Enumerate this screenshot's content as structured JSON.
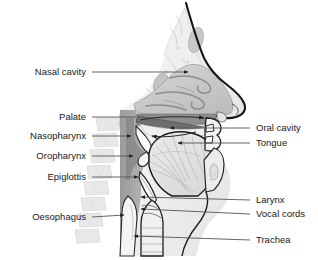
{
  "figure": {
    "background_color": "#ffffff",
    "text_color": "#1a1a1a",
    "leader_line_color": "#555555",
    "outline_color": "#1a1a1a"
  },
  "colors": {
    "skin_light": "#f2f2f2",
    "bone_light": "#e8e8e8",
    "nasal_cavity_fill": "#c9c9c9",
    "pharynx_fill": "#8f8f8f",
    "soft_tissue_mid": "#b5b5b5",
    "tongue_fill": "#e0e0e0",
    "airway_white": "#fbfbfb",
    "vertebrae_fill": "#dcdcdc",
    "dark_outline": "#111111"
  },
  "labels": {
    "left": [
      {
        "id": "nasal-cavity",
        "text": "Nasal cavity",
        "text_x": 86,
        "text_y": 72,
        "line_x1": 92,
        "line_y1": 72,
        "line_x2": 188,
        "line_y2": 72,
        "arrow": true
      },
      {
        "id": "palate",
        "text": "Palate",
        "text_x": 86,
        "text_y": 117,
        "line_x1": 92,
        "line_y1": 117,
        "line_x2": 136,
        "line_y2": 117,
        "arrow": false
      },
      {
        "id": "nasopharynx",
        "text": "Nasopharynx",
        "text_x": 86,
        "text_y": 136,
        "line_x1": 92,
        "line_y1": 136,
        "line_x2": 131,
        "line_y2": 136,
        "arrow": true
      },
      {
        "id": "oropharynx",
        "text": "Oropharynx",
        "text_x": 86,
        "text_y": 156,
        "line_x1": 92,
        "line_y1": 156,
        "line_x2": 133,
        "line_y2": 156,
        "arrow": true
      },
      {
        "id": "epiglottis",
        "text": "Epiglottis",
        "text_x": 86,
        "text_y": 177,
        "line_x1": 92,
        "line_y1": 177,
        "line_x2": 138,
        "line_y2": 177,
        "arrow": true
      },
      {
        "id": "oesophagus",
        "text": "Oesophagus",
        "text_x": 86,
        "text_y": 217,
        "line_x1": 92,
        "line_y1": 217,
        "line_x2": 124,
        "line_y2": 215,
        "arrow": true
      }
    ],
    "right": [
      {
        "id": "oral-cavity",
        "text": "Oral cavity",
        "text_x": 256,
        "text_y": 128,
        "line_x1": 250,
        "line_y1": 128,
        "line_x2": 170,
        "line_y2": 128,
        "arrow": true
      },
      {
        "id": "tongue",
        "text": "Tongue",
        "text_x": 256,
        "text_y": 143,
        "line_x1": 250,
        "line_y1": 143,
        "line_x2": 178,
        "line_y2": 143,
        "arrow": true
      },
      {
        "id": "larynx",
        "text": "Larynx",
        "text_x": 256,
        "text_y": 200,
        "line_x1": 250,
        "line_y1": 200,
        "line_x2": 141,
        "line_y2": 197,
        "arrow": true
      },
      {
        "id": "vocal-cords",
        "text": "Vocal cords",
        "text_x": 256,
        "text_y": 214,
        "line_x1": 250,
        "line_y1": 214,
        "line_x2": 141,
        "line_y2": 209,
        "arrow": true
      },
      {
        "id": "trachea",
        "text": "Trachea",
        "text_x": 256,
        "text_y": 240,
        "line_x1": 250,
        "line_y1": 240,
        "line_x2": 134,
        "line_y2": 236,
        "arrow": true
      }
    ]
  },
  "structures": [
    {
      "id": "nasal-cavity-region",
      "name": "Nasal cavity"
    },
    {
      "id": "palate-region",
      "name": "Palate"
    },
    {
      "id": "nasopharynx-region",
      "name": "Nasopharynx"
    },
    {
      "id": "oropharynx-region",
      "name": "Oropharynx"
    },
    {
      "id": "epiglottis-region",
      "name": "Epiglottis"
    },
    {
      "id": "oesophagus-region",
      "name": "Oesophagus"
    },
    {
      "id": "oral-cavity-region",
      "name": "Oral cavity"
    },
    {
      "id": "tongue-region",
      "name": "Tongue"
    },
    {
      "id": "larynx-region",
      "name": "Larynx"
    },
    {
      "id": "vocal-cords-region",
      "name": "Vocal cords"
    },
    {
      "id": "trachea-region",
      "name": "Trachea"
    },
    {
      "id": "vertebral-column",
      "name": "Vertebral column"
    },
    {
      "id": "nose-profile",
      "name": "Nose profile"
    },
    {
      "id": "lips-teeth",
      "name": "Lips and teeth"
    }
  ]
}
